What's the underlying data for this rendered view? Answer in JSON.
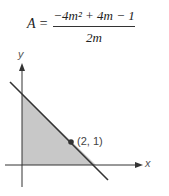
{
  "formula": {
    "lhs": "A =",
    "numerator": "−4m² + 4m − 1",
    "denominator": "2m"
  },
  "graph": {
    "x_axis_label": "x",
    "y_axis_label": "y",
    "point_label": "(2, 1)",
    "shade_color": "#c8c8c8",
    "line_color": "#333333"
  }
}
